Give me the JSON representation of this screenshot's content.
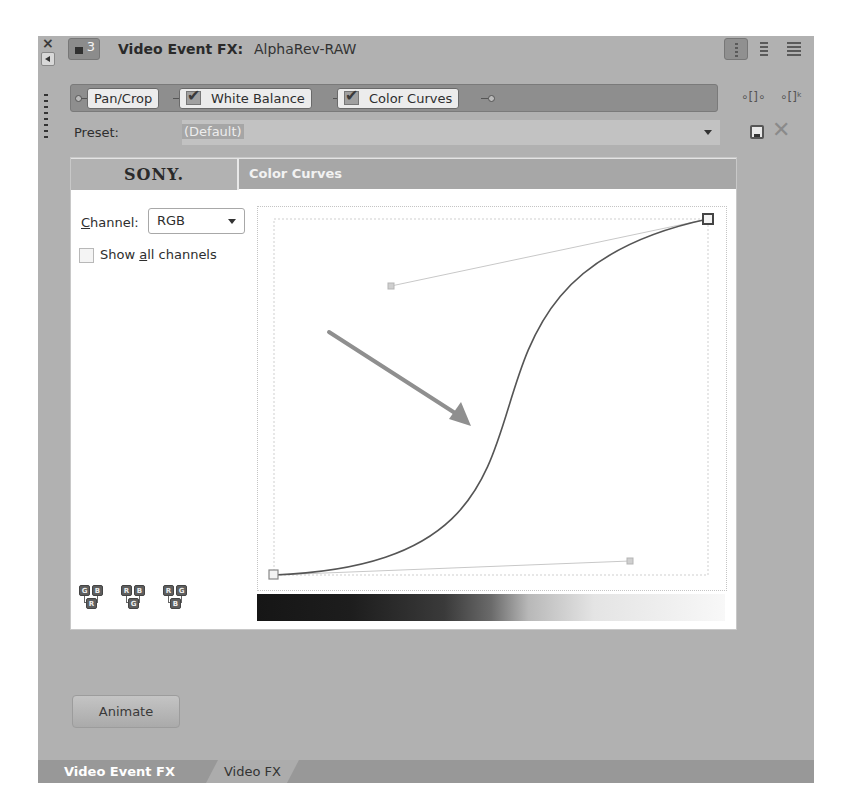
{
  "window": {
    "close_glyph": "×",
    "track_number": "3",
    "title_label": "Video Event FX:",
    "title_value": "AlphaRev-RAW",
    "view_buttons": [
      "list-view",
      "compact-view",
      "wide-view"
    ]
  },
  "fx_chain": {
    "nodes": [
      {
        "label": "Pan/Crop",
        "checked": null
      },
      {
        "label": "White Balance",
        "checked": true
      },
      {
        "label": "Color Curves",
        "checked": true
      }
    ],
    "side_icons": [
      "plugin-chain-icon",
      "remove-plugin-icon"
    ]
  },
  "preset": {
    "label": "Preset:",
    "value": "(Default)",
    "save_tooltip_icon": "save-icon",
    "delete_icon": "delete-icon"
  },
  "plugin": {
    "brand": "SONY.",
    "name": "Color Curves",
    "channel_label_prefix": "C",
    "channel_label_rest": "hannel:",
    "channel_value": "RGB",
    "show_all_prefix": "Show ",
    "show_all_underlined": "a",
    "show_all_rest": "ll channels",
    "show_all_checked": false,
    "channel_combos": [
      {
        "top": [
          "G",
          "B"
        ],
        "bottom": "R"
      },
      {
        "top": [
          "R",
          "B"
        ],
        "bottom": "G"
      },
      {
        "top": [
          "R",
          "G"
        ],
        "bottom": "B"
      }
    ],
    "curve": {
      "start_point": [
        0,
        0
      ],
      "end_point": [
        1,
        1
      ],
      "handle_start": [
        0.83,
        0.04
      ],
      "handle_end": [
        0.27,
        0.83
      ],
      "shape": "S-curve"
    },
    "annotation": "arrow pointing to curve midpoint"
  },
  "footer": {
    "animate_label": "Animate",
    "tabs": [
      {
        "label": "Video Event FX",
        "active": true
      },
      {
        "label": "Video FX",
        "active": false
      }
    ]
  },
  "colors": {
    "panel_bg": "#b1b1b1",
    "chain_bar": "#8e8e8e",
    "header_bg": "#a7a7a7",
    "annotation_arrow": "#8f8f8f",
    "curve": "#555555"
  }
}
